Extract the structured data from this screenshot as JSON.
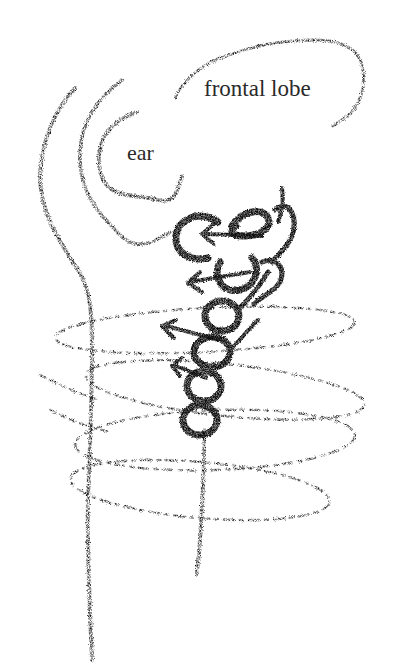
{
  "illustration": {
    "style": "black crayon sketch on white",
    "labels": {
      "frontal_lobe": "frontal lobe",
      "ear": "ear"
    },
    "colors": {
      "background": "#ffffff",
      "ink": "#111111",
      "label_text": "#2a2a2a"
    },
    "elements": [
      "outer-spine-curve",
      "inner-ear-arc",
      "ear-curl",
      "frontal-lobe-outline",
      "vertebrae-column",
      "nerve-arrows",
      "rib-ovals",
      "central-stem"
    ],
    "arrow_count": 5,
    "vertebra_count": 7,
    "rib_oval_count": 4
  }
}
